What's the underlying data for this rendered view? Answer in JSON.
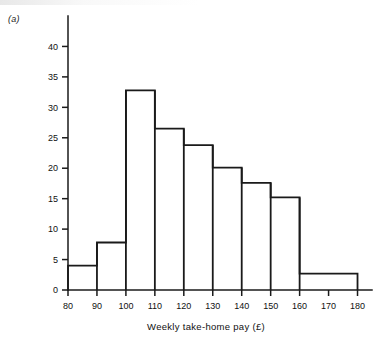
{
  "figure": {
    "panel_label": "(a)",
    "accent_color": "#1a1a1a",
    "background_color": "#ffffff"
  },
  "chart_data": {
    "type": "bar",
    "chart_subtype": "histogram",
    "title": "",
    "xlabel": "Weekly take-home pay (£)",
    "ylabel": "",
    "xlim": [
      80,
      185
    ],
    "ylim": [
      0,
      45
    ],
    "grid": false,
    "legend": null,
    "xticks": [
      80,
      90,
      100,
      110,
      120,
      130,
      140,
      150,
      160,
      170,
      180
    ],
    "xtick_labels": [
      "80",
      "90",
      "100",
      "110",
      "120",
      "130",
      "140",
      "150",
      "160",
      "170",
      "180"
    ],
    "yticks": [
      0,
      5,
      10,
      15,
      20,
      25,
      30,
      35,
      40
    ],
    "ytick_labels": [
      "0",
      "5",
      "10",
      "15",
      "20",
      "25",
      "30",
      "35",
      "40"
    ],
    "bin_edges": [
      80,
      90,
      100,
      110,
      120,
      130,
      140,
      150,
      160,
      180
    ],
    "categories": [
      "80-90",
      "90-100",
      "100-110",
      "110-120",
      "120-130",
      "130-140",
      "140-150",
      "150-160",
      "160-180"
    ],
    "values": [
      4.0,
      7.8,
      32.8,
      26.5,
      23.8,
      20.1,
      17.6,
      15.2,
      2.7
    ]
  }
}
